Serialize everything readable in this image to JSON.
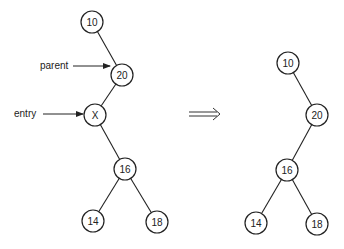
{
  "diagram": {
    "type": "binary-tree-deletion",
    "before": {
      "nodes": [
        {
          "id": "b10",
          "label": "10",
          "x": 92,
          "y": 22
        },
        {
          "id": "b20",
          "label": "20",
          "x": 122,
          "y": 75
        },
        {
          "id": "bX",
          "label": "X",
          "x": 95,
          "y": 115
        },
        {
          "id": "b16",
          "label": "16",
          "x": 125,
          "y": 169
        },
        {
          "id": "b14",
          "label": "14",
          "x": 93,
          "y": 221
        },
        {
          "id": "b18",
          "label": "18",
          "x": 157,
          "y": 222
        }
      ],
      "edges": [
        [
          "b10",
          "b20"
        ],
        [
          "b20",
          "bX"
        ],
        [
          "bX",
          "b16"
        ],
        [
          "b16",
          "b14"
        ],
        [
          "b16",
          "b18"
        ]
      ],
      "pointers": [
        {
          "label": "parent",
          "target": "b20"
        },
        {
          "label": "entry",
          "target": "bX"
        }
      ]
    },
    "transition_arrow": "⟹",
    "after": {
      "nodes": [
        {
          "id": "a10",
          "label": "10",
          "x": 288,
          "y": 63
        },
        {
          "id": "a20",
          "label": "20",
          "x": 317,
          "y": 115
        },
        {
          "id": "a16",
          "label": "16",
          "x": 287,
          "y": 170
        },
        {
          "id": "a14",
          "label": "14",
          "x": 256,
          "y": 223
        },
        {
          "id": "a18",
          "label": "18",
          "x": 317,
          "y": 224
        }
      ],
      "edges": [
        [
          "a10",
          "a20"
        ],
        [
          "a20",
          "a16"
        ],
        [
          "a16",
          "a14"
        ],
        [
          "a16",
          "a18"
        ]
      ]
    }
  }
}
